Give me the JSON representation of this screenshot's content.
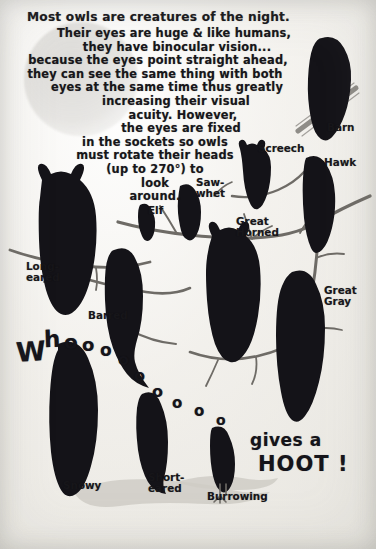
{
  "poster": {
    "headline": "Most owls are creatures of the night.",
    "body_lines": [
      "Their eyes are huge & like humans,",
      "they have binocular vision...",
      "because the eyes point straight ahead,",
      "they can see the same thing with both",
      "eyes at the same time thus greatly",
      "increasing their visual",
      "acuity. However,",
      "the eyes are fixed",
      "in the sockets  so owls",
      "must rotate their heads",
      "(up to 270°) to",
      "look",
      "around."
    ],
    "call_text": "Whooooooooo",
    "call_letters": [
      "W",
      "h",
      "o",
      "o",
      "o",
      "o",
      "o",
      "o",
      "o",
      "o",
      "o"
    ],
    "gives_a": "gives a",
    "hoot": "HOOT !"
  },
  "owls": [
    {
      "name": "Barn",
      "label": "Barn",
      "x": 327,
      "y": 122
    },
    {
      "name": "Screech",
      "label": "Screech",
      "x": 258,
      "y": 143
    },
    {
      "name": "Hawk",
      "label": "Hawk",
      "x": 324,
      "y": 157
    },
    {
      "name": "Saw-whet",
      "label": "Saw-\nwhet",
      "x": 196,
      "y": 177
    },
    {
      "name": "Elf",
      "label": "Elf",
      "x": 148,
      "y": 205
    },
    {
      "name": "Great Horned",
      "label": "Great\nHorned",
      "x": 236,
      "y": 216
    },
    {
      "name": "Long-eared",
      "label": "Long-\neared",
      "x": 26,
      "y": 261
    },
    {
      "name": "Great Gray",
      "label": "Great\nGray",
      "x": 324,
      "y": 285
    },
    {
      "name": "Barred",
      "label": "Barred",
      "x": 88,
      "y": 310
    },
    {
      "name": "Snowy",
      "label": "Snowy",
      "x": 63,
      "y": 480
    },
    {
      "name": "Short-eared",
      "label": "Short-\neared",
      "x": 148,
      "y": 472
    },
    {
      "name": "Burrowing",
      "label": "Burrowing",
      "x": 207,
      "y": 491
    }
  ],
  "colors": {
    "paper": "#f2f0ec",
    "ink": "#141318",
    "branch": "#6e6b66",
    "moon": "#cdcbc7",
    "ground": "#cfccc6"
  }
}
